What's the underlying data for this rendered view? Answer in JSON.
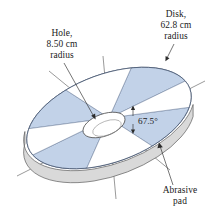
{
  "figure": {
    "background_color": "#ffffff",
    "pad_color": "#c2d2e8",
    "rim_color": "#d9d9d9",
    "outline_color": "#4a5a74"
  },
  "annotations": {
    "disk": {
      "line1": "Disk,",
      "line2": "62.8 cm",
      "line3": "radius"
    },
    "hole": {
      "line1": "Hole,",
      "line2": "8.50 cm",
      "line3": "radius"
    },
    "angle": {
      "value": "67.5°"
    },
    "abrasive": {
      "line1": "Abrasive",
      "line2": "pad"
    }
  },
  "geometry": {
    "disk_radius_cm": 62.8,
    "hole_radius_cm": 8.5,
    "pad_angle_deg": 67.5,
    "pad_count": 4,
    "sector_count": 8
  }
}
